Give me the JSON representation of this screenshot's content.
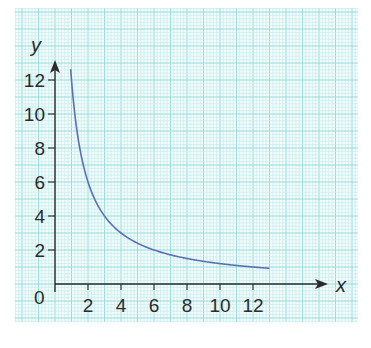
{
  "chart_data": {
    "type": "line",
    "title": "",
    "xlabel": "x",
    "ylabel": "y",
    "xlim": [
      0,
      13
    ],
    "ylim": [
      0,
      13
    ],
    "x_ticks": [
      2,
      4,
      6,
      8,
      10,
      12
    ],
    "y_ticks": [
      2,
      4,
      6,
      8,
      10,
      12
    ],
    "origin_label": "0",
    "grid": true,
    "legend": null,
    "series": [
      {
        "name": "y = 12/x",
        "function": "12/x",
        "x": [
          0.92,
          1,
          1.5,
          2,
          3,
          4,
          5,
          6,
          7,
          8,
          9,
          10,
          11,
          12,
          13
        ],
        "values": [
          13.0,
          12.0,
          8.0,
          6.0,
          4.0,
          3.0,
          2.4,
          2.0,
          1.71,
          1.5,
          1.33,
          1.2,
          1.09,
          1.0,
          0.92
        ]
      }
    ]
  },
  "colors": {
    "grid_fine": "#bfeaea",
    "grid_major": "#8fd8d8",
    "axis": "#2b2b2b",
    "curve": "#5a6fb5",
    "background": "#f4fcfc"
  },
  "labels": {
    "x_axis": "x",
    "y_axis": "y",
    "origin": "0",
    "x_tick_labels": [
      "2",
      "4",
      "6",
      "8",
      "10",
      "12"
    ],
    "y_tick_labels": [
      "2",
      "4",
      "6",
      "8",
      "10",
      "12"
    ]
  }
}
